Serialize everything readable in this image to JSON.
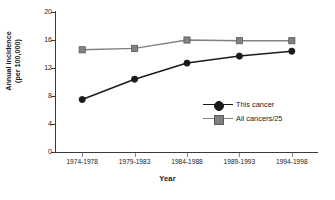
{
  "chart_data": {
    "type": "line",
    "title": "",
    "xlabel": "Year",
    "ylabel": "Annual incidence (per 100,000)",
    "ylabel_line1": "Annual incidence",
    "ylabel_line2": "(per 100,000)",
    "categories": [
      "1974-1978",
      "1979-1983",
      "1984-1988",
      "1989-1993",
      "1994-1998"
    ],
    "yticks": [
      0,
      4,
      8,
      12,
      16,
      20
    ],
    "ylim": [
      0,
      20
    ],
    "grid": false,
    "legend_position": "inside-right",
    "series": [
      {
        "name": "This cancer",
        "marker": "circle",
        "color": "#1a1a1a",
        "values": [
          7.5,
          10.4,
          12.7,
          13.7,
          14.4
        ]
      },
      {
        "name": "All cancers/25",
        "marker": "square",
        "color": "#808080",
        "values": [
          14.6,
          14.8,
          16.0,
          15.9,
          15.9
        ]
      }
    ]
  }
}
